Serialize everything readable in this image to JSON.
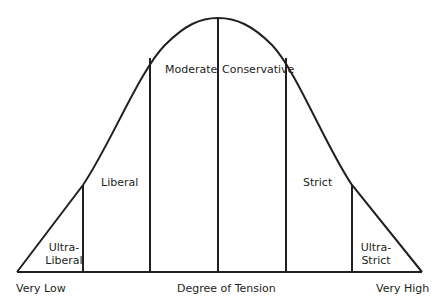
{
  "diagram": {
    "type": "bell-curve",
    "x_axis_label": "Degree of Tension",
    "x_axis_low": "Very Low",
    "x_axis_high": "Very High",
    "line_color": "#231f20",
    "background": "#ffffff",
    "segments": [
      {
        "label_line1": "Ultra-",
        "label_line2": "Liberal"
      },
      {
        "label": "Liberal"
      },
      {
        "label": "Moderate"
      },
      {
        "label": "Conservative"
      },
      {
        "label": "Strict"
      },
      {
        "label_line1": "Ultra-",
        "label_line2": "Strict"
      }
    ]
  }
}
